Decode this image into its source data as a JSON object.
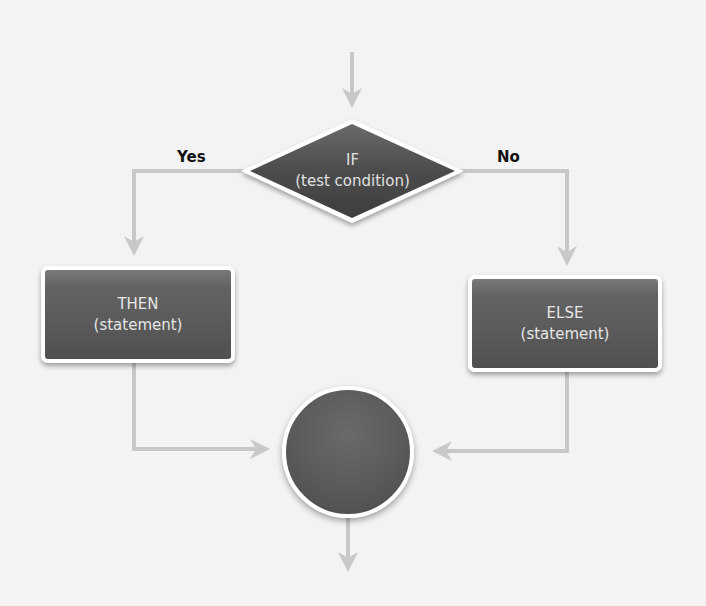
{
  "diagram": {
    "type": "flowchart",
    "decision": {
      "line1": "IF",
      "line2": "(test condition)"
    },
    "then_box": {
      "line1": "THEN",
      "line2": "(statement)"
    },
    "else_box": {
      "line1": "ELSE",
      "line2": "(statement)"
    },
    "branch_labels": {
      "yes": "Yes",
      "no": "No"
    },
    "merge_node": {
      "label": ""
    },
    "colors": {
      "background": "#f3f3f3",
      "shape_fill": "#5a5a5a",
      "shape_border": "#ffffff",
      "connector": "#c8c8c8",
      "shape_text": "#e6e6e6",
      "label_text": "#111111"
    },
    "edges": [
      {
        "from": "entry",
        "to": "decision"
      },
      {
        "from": "decision",
        "to": "then_box",
        "label": "Yes"
      },
      {
        "from": "decision",
        "to": "else_box",
        "label": "No"
      },
      {
        "from": "then_box",
        "to": "merge_node"
      },
      {
        "from": "else_box",
        "to": "merge_node"
      },
      {
        "from": "merge_node",
        "to": "exit"
      }
    ]
  }
}
